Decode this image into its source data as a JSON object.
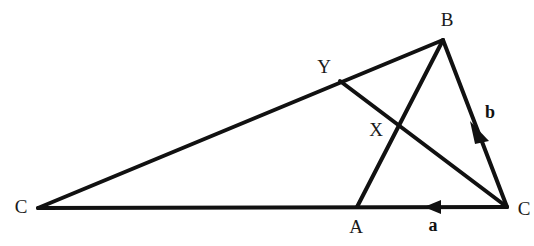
{
  "figure": {
    "width": 534,
    "height": 246,
    "background_color": "#ffffff",
    "stroke_color": "#111111"
  },
  "points": {
    "C_left": {
      "label": "C",
      "x": 38,
      "y": 208,
      "label_x": 21,
      "label_y": 206
    },
    "B": {
      "label": "B",
      "x": 443,
      "y": 40,
      "label_x": 447,
      "label_y": 19
    },
    "C_right": {
      "label": "C",
      "x": 507,
      "y": 207,
      "label_x": 524,
      "label_y": 208
    },
    "A": {
      "label": "A",
      "x": 357,
      "y": 207,
      "label_x": 356,
      "label_y": 226
    },
    "X": {
      "label": "X",
      "x": 397,
      "y": 125,
      "label_x": 376,
      "label_y": 129
    },
    "Y": {
      "label": "Y",
      "x": 340,
      "y": 81,
      "label_x": 324,
      "label_y": 66
    }
  },
  "segments": [
    {
      "name": "segment-C-left-to-B",
      "from": "C_left",
      "to": "B"
    },
    {
      "name": "segment-C-left-to-C-right",
      "from": "C_left",
      "to": "C_right"
    },
    {
      "name": "segment-B-to-C-right",
      "from": "B",
      "to": "C_right"
    },
    {
      "name": "segment-A-to-B",
      "from": "A",
      "to": "B"
    },
    {
      "name": "segment-Y-to-C-right",
      "from": "Y",
      "to": "C_right"
    }
  ],
  "vectors": [
    {
      "name": "vector-a",
      "label": "a",
      "label_x": 433,
      "label_y": 225,
      "tip_x": 425,
      "tip_y": 207,
      "direction": "left",
      "along": "segment-C-left-to-C-right"
    },
    {
      "name": "vector-b",
      "label": "b",
      "label_x": 490,
      "label_y": 112,
      "tip_x": 474,
      "tip_y": 124,
      "direction": "up-left",
      "along": "segment-B-to-C-right"
    }
  ]
}
